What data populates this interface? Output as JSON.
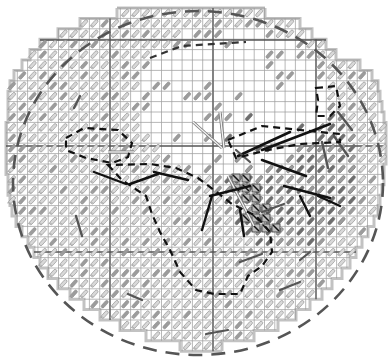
{
  "canvas": {
    "width": 392,
    "height": 364,
    "background": "#ffffff"
  },
  "grid": {
    "cell": 10.3,
    "origin_x": 7,
    "origin_y": 8,
    "cols": 37,
    "rows": 34,
    "thin_color": "#9a9a9a",
    "axis_color": "#555555",
    "axis_cols_x": [
      110,
      213,
      316
    ],
    "axis_rows_y": [
      40,
      146,
      252
    ]
  },
  "boundary": {
    "color": "#c2c2c2",
    "row_spans": [
      [
        117,
        265
      ],
      [
        80,
        300
      ],
      [
        58,
        312
      ],
      [
        40,
        326
      ],
      [
        30,
        336
      ],
      [
        22,
        360
      ],
      [
        14,
        372
      ],
      [
        10,
        378
      ],
      [
        8,
        380
      ],
      [
        8,
        382
      ],
      [
        8,
        384
      ],
      [
        6,
        386
      ],
      [
        6,
        386
      ],
      [
        6,
        386
      ],
      [
        6,
        386
      ],
      [
        6,
        384
      ],
      [
        8,
        384
      ],
      [
        8,
        382
      ],
      [
        10,
        380
      ],
      [
        12,
        378
      ],
      [
        16,
        374
      ],
      [
        22,
        368
      ],
      [
        28,
        362
      ],
      [
        34,
        356
      ],
      [
        40,
        350
      ],
      [
        48,
        342
      ],
      [
        58,
        332
      ],
      [
        70,
        322
      ],
      [
        84,
        310
      ],
      [
        100,
        296
      ],
      [
        120,
        278
      ],
      [
        146,
        254
      ],
      [
        180,
        222
      ]
    ],
    "row_height": 10.4,
    "top_y": 8
  },
  "region_masks": {
    "open_zone": {
      "cx": 230,
      "cy": 100,
      "rx": 95,
      "ry": 75
    },
    "open_zone_note": "upper-central area shows empty grid cells (no glyphs)"
  },
  "glyph_style": {
    "outline_color": "#8c8c8c",
    "fill_light": "#d8d8d8",
    "fill_mid": "#9c9c9c",
    "fill_dark": "#6e6e6e",
    "angle_deg": -48
  },
  "outer_dashed_circle": {
    "cx": 198,
    "cy": 183,
    "rx": 185,
    "ry": 172,
    "color": "#555555",
    "dash": "14 9",
    "width": 2.6
  },
  "dashed_regions": [
    {
      "name": "left-cluster",
      "color": "#111111",
      "points": [
        [
          66,
          138
        ],
        [
          84,
          128
        ],
        [
          118,
          130
        ],
        [
          132,
          143
        ],
        [
          128,
          157
        ],
        [
          112,
          163
        ],
        [
          86,
          158
        ],
        [
          66,
          150
        ]
      ]
    },
    {
      "name": "center-south-region",
      "color": "#111111",
      "points": [
        [
          108,
          165
        ],
        [
          122,
          180
        ],
        [
          146,
          196
        ],
        [
          152,
          214
        ],
        [
          160,
          232
        ],
        [
          170,
          250
        ],
        [
          180,
          272
        ],
        [
          196,
          290
        ],
        [
          214,
          294
        ],
        [
          240,
          294
        ],
        [
          248,
          276
        ],
        [
          262,
          266
        ],
        [
          272,
          252
        ],
        [
          270,
          232
        ],
        [
          256,
          216
        ],
        [
          232,
          204
        ],
        [
          214,
          190
        ],
        [
          198,
          178
        ],
        [
          176,
          168
        ],
        [
          150,
          164
        ]
      ]
    },
    {
      "name": "north-east-hook",
      "color": "#111111",
      "points": [
        [
          316,
          88
        ],
        [
          336,
          86
        ],
        [
          340,
          106
        ],
        [
          330,
          116
        ],
        [
          316,
          116
        ],
        [
          318,
          100
        ]
      ]
    },
    {
      "name": "east-band",
      "color": "#111111",
      "points": [
        [
          228,
          140
        ],
        [
          262,
          126
        ],
        [
          300,
          130
        ],
        [
          340,
          134
        ],
        [
          340,
          142
        ],
        [
          300,
          144
        ],
        [
          268,
          150
        ],
        [
          236,
          158
        ]
      ]
    },
    {
      "name": "center-north-dash",
      "color": "#333333",
      "points": [
        [
          150,
          58
        ],
        [
          182,
          46
        ],
        [
          246,
          42
        ]
      ]
    }
  ],
  "solid_segments": [
    {
      "x1": 238,
      "y1": 156,
      "x2": 290,
      "y2": 132,
      "color": "#111111",
      "w": 2.6
    },
    {
      "x1": 262,
      "y1": 150,
      "x2": 330,
      "y2": 124,
      "color": "#111111",
      "w": 2.6
    },
    {
      "x1": 262,
      "y1": 160,
      "x2": 306,
      "y2": 176,
      "color": "#111111",
      "w": 2.6
    },
    {
      "x1": 284,
      "y1": 186,
      "x2": 330,
      "y2": 198,
      "color": "#111111",
      "w": 2.4
    },
    {
      "x1": 210,
      "y1": 196,
      "x2": 250,
      "y2": 186,
      "color": "#111111",
      "w": 2.4
    },
    {
      "x1": 154,
      "y1": 172,
      "x2": 188,
      "y2": 180,
      "color": "#111111",
      "w": 2.4
    },
    {
      "x1": 130,
      "y1": 184,
      "x2": 158,
      "y2": 174,
      "color": "#111111",
      "w": 2.4
    },
    {
      "x1": 94,
      "y1": 172,
      "x2": 126,
      "y2": 184,
      "color": "#111111",
      "w": 2.4
    },
    {
      "x1": 212,
      "y1": 196,
      "x2": 202,
      "y2": 230,
      "color": "#111111",
      "w": 2.4
    },
    {
      "x1": 240,
      "y1": 210,
      "x2": 244,
      "y2": 236,
      "color": "#111111",
      "w": 2.4
    },
    {
      "x1": 300,
      "y1": 196,
      "x2": 310,
      "y2": 216,
      "color": "#111111",
      "w": 2.4
    },
    {
      "x1": 318,
      "y1": 196,
      "x2": 340,
      "y2": 206,
      "color": "#111111",
      "w": 2.4
    },
    {
      "x1": 80,
      "y1": 96,
      "x2": 74,
      "y2": 108,
      "color": "#555555",
      "w": 2.4
    },
    {
      "x1": 76,
      "y1": 216,
      "x2": 82,
      "y2": 236,
      "color": "#555555",
      "w": 2.4
    },
    {
      "x1": 128,
      "y1": 294,
      "x2": 142,
      "y2": 300,
      "color": "#555555",
      "w": 2.4
    },
    {
      "x1": 250,
      "y1": 162,
      "x2": 236,
      "y2": 150,
      "color": "#555555",
      "w": 2.2
    },
    {
      "x1": 338,
      "y1": 112,
      "x2": 352,
      "y2": 130,
      "color": "#555555",
      "w": 2.4
    },
    {
      "x1": 334,
      "y1": 136,
      "x2": 348,
      "y2": 156,
      "color": "#555555",
      "w": 2.4
    },
    {
      "x1": 322,
      "y1": 142,
      "x2": 328,
      "y2": 168,
      "color": "#555555",
      "w": 2.4
    },
    {
      "x1": 262,
      "y1": 212,
      "x2": 284,
      "y2": 204,
      "color": "#555555",
      "w": 2.2
    },
    {
      "x1": 240,
      "y1": 262,
      "x2": 262,
      "y2": 254,
      "color": "#555555",
      "w": 2.2
    },
    {
      "x1": 206,
      "y1": 334,
      "x2": 228,
      "y2": 330,
      "color": "#555555",
      "w": 2.2
    },
    {
      "x1": 280,
      "y1": 290,
      "x2": 300,
      "y2": 282,
      "color": "#555555",
      "w": 2.2
    },
    {
      "x1": 300,
      "y1": 260,
      "x2": 310,
      "y2": 252,
      "color": "#555555",
      "w": 2.2
    }
  ],
  "double_lines": [
    {
      "x1": 193,
      "y1": 122,
      "x2": 222,
      "y2": 148,
      "color": "#b5b5b5"
    },
    {
      "x1": 220,
      "y1": 112,
      "x2": 224,
      "y2": 148,
      "color": "#b5b5b5"
    },
    {
      "x1": 228,
      "y1": 176,
      "x2": 254,
      "y2": 226,
      "color": "#b5b5b5"
    },
    {
      "x1": 108,
      "y1": 152,
      "x2": 134,
      "y2": 152,
      "color": "#b5b5b5"
    }
  ],
  "marked_cells": [
    [
      236,
      178
    ],
    [
      246,
      178
    ],
    [
      236,
      188
    ],
    [
      246,
      188
    ],
    [
      256,
      188
    ],
    [
      246,
      198
    ],
    [
      256,
      198
    ],
    [
      256,
      208
    ],
    [
      266,
      208
    ],
    [
      246,
      218
    ],
    [
      256,
      218
    ],
    [
      266,
      218
    ],
    [
      256,
      228
    ],
    [
      266,
      228
    ],
    [
      276,
      228
    ]
  ],
  "dense_zone": {
    "cx": 290,
    "cy": 170,
    "rx": 70,
    "ry": 80
  },
  "random_seed": 7
}
